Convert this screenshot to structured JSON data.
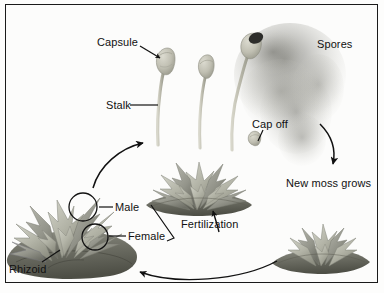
{
  "figure": {
    "frame_color": "#1a1a1a",
    "background_color": "#fcfcfb"
  },
  "labels": {
    "capsule": "Capsule",
    "stalk": "Stalk",
    "spores": "Spores",
    "cap_off": "Cap off",
    "new_moss_grows": "New moss grows",
    "male": "Male",
    "female": "Female",
    "fertilization": "Fertilization",
    "rhizoid": "Rhizoid"
  },
  "colors": {
    "moss_light": "#c9cabf",
    "moss_mid": "#a8a99c",
    "moss_dark": "#7d7e72",
    "moss_base_dark": "#5f6055",
    "stalk": "#c3c2b4",
    "capsule": "#c6c5b6",
    "spore_cloud": "#9a9a94",
    "ink": "#111111"
  },
  "structures": [
    {
      "name": "sporophyte-capsule-left",
      "label_ref": "capsule"
    },
    {
      "name": "sporophyte-stalk-left",
      "label_ref": "stalk"
    },
    {
      "name": "sporophyte-capsule-middle",
      "label_ref": null
    },
    {
      "name": "sporophyte-capsule-right-open",
      "label_ref": "spores"
    },
    {
      "name": "detached-cap",
      "label_ref": "cap_off"
    },
    {
      "name": "spore-cloud",
      "label_ref": "spores"
    },
    {
      "name": "new-moss-plant",
      "label_ref": "new_moss_grows"
    },
    {
      "name": "gametophyte-clump",
      "label_ref": null
    },
    {
      "name": "male-antheridium",
      "label_ref": "male"
    },
    {
      "name": "female-archegonium",
      "label_ref": "female"
    },
    {
      "name": "rhizoid-base",
      "label_ref": "rhizoid"
    },
    {
      "name": "fertilization-site",
      "label_ref": "fertilization"
    }
  ],
  "arrows": [
    {
      "name": "arrow-gametophyte-to-sporophyte",
      "direction": "up-right"
    },
    {
      "name": "arrow-spores-to-new-moss",
      "direction": "down"
    },
    {
      "name": "arrow-new-moss-to-gametophyte",
      "direction": "left"
    },
    {
      "name": "arrow-fertilization-pointer",
      "direction": "up"
    }
  ]
}
